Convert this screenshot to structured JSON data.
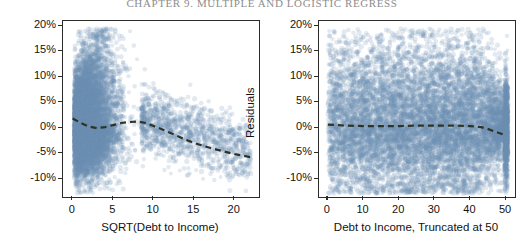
{
  "running_head": "CHAPTER 9.  MULTIPLE AND LOGISTIC REGRESS",
  "chart_data": [
    {
      "id": "left",
      "type": "scatter",
      "title": "",
      "xlabel": "SQRT(Debt to Income)",
      "ylabel": "Residuals",
      "xlim": [
        -1.2,
        23.0
      ],
      "ylim": [
        -13.5,
        21.0
      ],
      "xticks": [
        0,
        5,
        10,
        15,
        20
      ],
      "xticklabels": [
        "0",
        "5",
        "10",
        "15",
        "20"
      ],
      "yticks": [
        20,
        15,
        10,
        5,
        0,
        -5,
        -10
      ],
      "yticklabels": [
        "20%",
        "15%",
        "10%",
        "5%",
        "0%",
        "-5%",
        "-10%"
      ],
      "grid": false,
      "legend": null,
      "point_color": "#6d8fb4",
      "point_opacity": 0.2,
      "n_points": 9500,
      "cloud_description": "dense teardrop cloud concentrated between x=0 and x=9, widest near x=2-6, extending from y=-12% up to y=19%, thinning to sparse outliers out to x=22",
      "trend": {
        "name": "loess smoother",
        "style": "dashed",
        "color": "#2f3326",
        "points": [
          [
            0.0,
            1.9
          ],
          [
            1.0,
            1.0
          ],
          [
            2.0,
            0.3
          ],
          [
            3.0,
            0.0
          ],
          [
            4.0,
            0.2
          ],
          [
            5.0,
            0.6
          ],
          [
            6.0,
            1.0
          ],
          [
            7.0,
            1.2
          ],
          [
            8.0,
            1.3
          ],
          [
            9.0,
            1.0
          ],
          [
            10.0,
            0.4
          ],
          [
            11.0,
            -0.2
          ],
          [
            12.0,
            -0.9
          ],
          [
            13.0,
            -1.6
          ],
          [
            14.0,
            -2.3
          ],
          [
            15.0,
            -2.9
          ],
          [
            16.0,
            -3.4
          ],
          [
            17.0,
            -3.9
          ],
          [
            18.0,
            -4.3
          ],
          [
            19.0,
            -4.7
          ],
          [
            20.0,
            -5.1
          ],
          [
            21.0,
            -5.4
          ],
          [
            22.0,
            -5.7
          ]
        ]
      }
    },
    {
      "id": "right",
      "type": "scatter",
      "title": "",
      "xlabel": "Debt to Income, Truncated at 50",
      "ylabel": "Residuals",
      "xlim": [
        -2.5,
        52.5
      ],
      "ylim": [
        -13.5,
        21.0
      ],
      "xticks": [
        0,
        10,
        20,
        30,
        40,
        50
      ],
      "xticklabels": [
        "0",
        "10",
        "20",
        "30",
        "40",
        "50"
      ],
      "yticks": [
        20,
        15,
        10,
        5,
        0,
        -5,
        -10
      ],
      "yticklabels": [
        "20%",
        "15%",
        "10%",
        "5%",
        "0%",
        "-5%",
        "-10%"
      ],
      "grid": false,
      "legend": null,
      "point_color": "#6d8fb4",
      "point_opacity": 0.2,
      "n_points": 9500,
      "cloud_description": "broad horizontal band spanning the full x range 0 to 50, dense core from y=-7% to y=+7%, fading above to 18% and below to -12%; a pronounced dense vertical stripe of piled-up points at x=50 where values are truncated",
      "trend": {
        "name": "loess smoother",
        "style": "dashed",
        "color": "#2f3326",
        "points": [
          [
            0.0,
            0.7
          ],
          [
            5.0,
            0.5
          ],
          [
            10.0,
            0.4
          ],
          [
            15.0,
            0.4
          ],
          [
            20.0,
            0.4
          ],
          [
            25.0,
            0.5
          ],
          [
            30.0,
            0.5
          ],
          [
            35.0,
            0.5
          ],
          [
            40.0,
            0.4
          ],
          [
            43.0,
            0.2
          ],
          [
            45.0,
            -0.2
          ],
          [
            47.0,
            -0.7
          ],
          [
            49.0,
            -1.2
          ],
          [
            50.0,
            -1.5
          ]
        ]
      }
    }
  ]
}
